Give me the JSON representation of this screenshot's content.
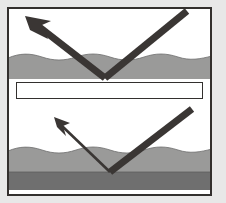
{
  "figure": {
    "background_color": "#e8e8e8",
    "frame": {
      "border_color": "#33302e",
      "fill_color": "#ffffff",
      "x": 7,
      "y": 7,
      "width": 205,
      "height": 189,
      "stroke_width": 2
    },
    "colors": {
      "ray": "#3a3634",
      "surface_light_gray": "#9a9a99",
      "surface_dark_gray": "#6f6f6f",
      "panel_white": "#ffffff",
      "divider_border": "#33302e"
    },
    "panels": [
      {
        "id": "top-panel",
        "label": "Strong reflection from single layer",
        "layers": [
          {
            "name": "upper-layer",
            "fill": "#9a9a99",
            "top_y": 57,
            "bottom_y": 79,
            "surface": "wavy"
          }
        ],
        "incoming_ray": {
          "name": "incoming-ray-strong",
          "from_x": 187,
          "from_y": 11,
          "to_x": 105,
          "to_y": 78,
          "width": 7,
          "arrowhead": false
        },
        "outgoing_ray": {
          "name": "outgoing-ray-strong",
          "from_x": 105,
          "from_y": 78,
          "to_x": 36,
          "to_y": 25,
          "width": 7,
          "arrowhead": true,
          "arrowhead_size": "large",
          "arrow_tip_x": 26,
          "arrow_tip_y": 17
        },
        "reflection_point": {
          "x": 105,
          "y": 78
        }
      },
      {
        "id": "bottom-panel",
        "label": "Weak reflection from two-layer surface",
        "layers": [
          {
            "name": "upper-layer",
            "fill": "#9a9a99",
            "top_y": 150,
            "bottom_y": 172,
            "surface": "wavy"
          },
          {
            "name": "lower-layer",
            "fill": "#6f6f6f",
            "top_y": 172,
            "bottom_y": 190,
            "surface": "flat"
          }
        ],
        "incoming_ray": {
          "name": "incoming-ray-weak",
          "from_x": 192,
          "from_y": 109,
          "to_x": 110,
          "to_y": 172,
          "width": 7,
          "arrowhead": false
        },
        "outgoing_ray": {
          "name": "outgoing-ray-weak",
          "from_x": 110,
          "from_y": 172,
          "to_x": 62,
          "to_y": 126,
          "width": 2.6,
          "arrowhead": true,
          "arrowhead_size": "small",
          "arrow_tip_x": 55,
          "arrow_tip_y": 118
        },
        "reflection_point": {
          "x": 110,
          "y": 172
        }
      }
    ],
    "divider": {
      "name": "panel-divider",
      "x": 16,
      "y": 82,
      "width": 186,
      "height": 17,
      "fill": "#ffffff",
      "border_color": "#33302e"
    }
  }
}
